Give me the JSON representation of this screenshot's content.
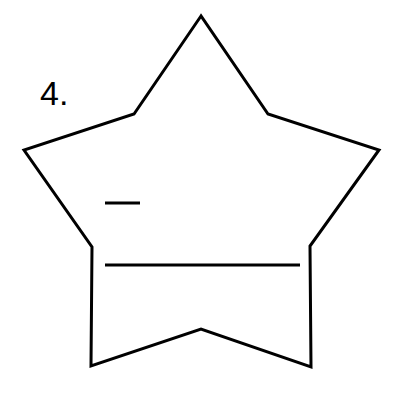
{
  "problem": {
    "number_label": "4."
  },
  "figure": {
    "stroke_color": "#000000",
    "background": "#ffffff",
    "star_outline_points": "201,16 134,114 24,150 92,247 91,366 201,329 311,367 310,246 379,150 268,114",
    "answer_blanks": [
      {
        "name": "numerator-blank",
        "x1": 105,
        "y1": 203,
        "x2": 140,
        "y2": 203
      },
      {
        "name": "answer-line",
        "x1": 105,
        "y1": 265,
        "x2": 300,
        "y2": 265
      }
    ]
  }
}
